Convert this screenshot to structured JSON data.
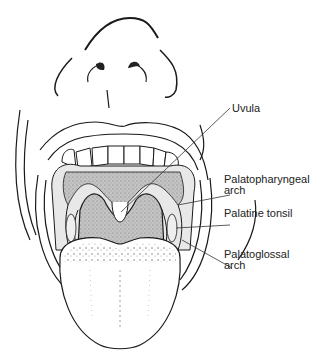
{
  "figure": {
    "labels": {
      "uvula": "Uvula",
      "palatopharyngeal_line1": "Palatopharyngeal",
      "palatopharyngeal_line2": "arch",
      "palatine_tonsil": "Palatine tonsil",
      "palatoglossal_line1": "Palatoglossal",
      "palatoglossal_line2": "arch"
    },
    "colors": {
      "line": "#1a1a1a",
      "shade": "#b8b8b8",
      "background": "#ffffff"
    }
  }
}
